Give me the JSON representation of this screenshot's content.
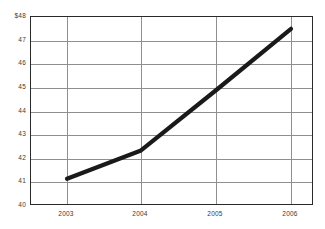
{
  "chart_data": {
    "type": "line",
    "title": "",
    "subtitle": "",
    "xlabel": "",
    "ylabel": "",
    "categories": [
      "2003",
      "2004",
      "2005",
      "2006"
    ],
    "x": [
      2003,
      2004,
      2005,
      2006
    ],
    "series": [
      {
        "name": "",
        "values": [
          41.15,
          42.35,
          44.9,
          47.5
        ]
      }
    ],
    "values": [
      41.15,
      42.35,
      44.9,
      47.5
    ],
    "xlim": [
      2002.5,
      2006.3
    ],
    "ylim": [
      40,
      48
    ],
    "ytick_labels": [
      "$48",
      "47",
      "46",
      "45",
      "44",
      "43",
      "42",
      "41",
      "40"
    ],
    "ytick_values": [
      48,
      47,
      46,
      45,
      44,
      43,
      42,
      41,
      40
    ],
    "xtick_labels": [
      "2003",
      "2004",
      "2005",
      "2006"
    ],
    "grid": true,
    "grid_axis": "both",
    "legend": false,
    "legend_position": "none",
    "currency_prefix": "$",
    "colors": {
      "line": "#1a1a1a",
      "grid": "#8f8f8f",
      "frame": "#2a2a2a",
      "text": "#3a3a3a",
      "background": "#ffffff"
    },
    "line_width_px": 4.2,
    "markers": false,
    "annotations": []
  }
}
